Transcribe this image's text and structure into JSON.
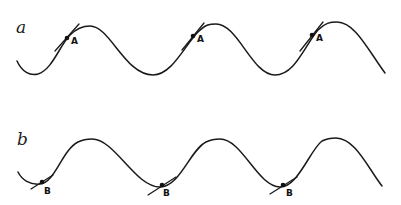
{
  "figure": {
    "panels": [
      {
        "label": "a",
        "point_label": "A",
        "description": "Wave with tangents at point A on rising slope near crest",
        "points": [
          {
            "label": "A",
            "x": 67,
            "y": 38
          },
          {
            "label": "A",
            "x": 193,
            "y": 36
          },
          {
            "label": "A",
            "x": 312,
            "y": 35
          }
        ]
      },
      {
        "label": "b",
        "point_label": "B",
        "description": "Wave with tangents at point B near trough",
        "points": [
          {
            "label": "B",
            "x": 42,
            "y": 182
          },
          {
            "label": "B",
            "x": 162,
            "y": 185
          },
          {
            "label": "B",
            "x": 283,
            "y": 185
          }
        ]
      }
    ],
    "colors": {
      "line": "#1a1a1a",
      "background": "#ffffff"
    }
  }
}
